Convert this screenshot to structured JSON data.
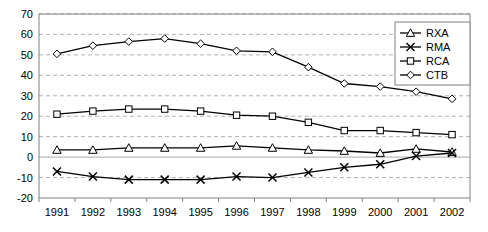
{
  "chart_data": {
    "type": "line",
    "title": "",
    "subtitle": "",
    "xlabel": "",
    "ylabel": "",
    "categories": [
      "1991",
      "1992",
      "1993",
      "1994",
      "1995",
      "1996",
      "1997",
      "1998",
      "1999",
      "2000",
      "2001",
      "2002"
    ],
    "x": [
      1991,
      1992,
      1993,
      1994,
      1995,
      1996,
      1997,
      1998,
      1999,
      2000,
      2001,
      2002
    ],
    "ylim": [
      -20,
      70
    ],
    "yticks": [
      -20,
      -10,
      0,
      10,
      20,
      30,
      40,
      50,
      60,
      70
    ],
    "ytick_labels": [
      "-20",
      "-10",
      "0",
      "10",
      "20",
      "30",
      "40",
      "50",
      "60",
      "70"
    ],
    "grid": true,
    "grid_style": "dashed",
    "grid_color": "#999999",
    "zero_line": true,
    "legend_position": "top-right",
    "legend_border": true,
    "series": [
      {
        "name": "RXA",
        "marker": "triangle",
        "color": "#000000",
        "values": [
          3.5,
          3.5,
          4.5,
          4.5,
          4.5,
          5.5,
          4.5,
          3.5,
          3.0,
          2.0,
          4.0,
          2.5
        ]
      },
      {
        "name": "RMA",
        "marker": "cross",
        "color": "#000000",
        "values": [
          -7.0,
          -9.5,
          -11.0,
          -11.0,
          -11.0,
          -9.5,
          -10.0,
          -7.5,
          -5.0,
          -3.5,
          0.5,
          2.0
        ]
      },
      {
        "name": "RCA",
        "marker": "square",
        "color": "#000000",
        "values": [
          21.0,
          22.5,
          23.5,
          23.5,
          22.5,
          20.5,
          20.0,
          17.0,
          13.0,
          13.0,
          12.0,
          11.0
        ]
      },
      {
        "name": "CTB",
        "marker": "diamond",
        "color": "#000000",
        "values": [
          50.5,
          54.5,
          56.5,
          58.0,
          55.5,
          52.0,
          51.5,
          44.0,
          36.0,
          34.5,
          32.0,
          28.5
        ]
      }
    ]
  },
  "legend": {
    "entries": [
      {
        "label": "RXA",
        "marker": "triangle"
      },
      {
        "label": "RMA",
        "marker": "cross"
      },
      {
        "label": "RCA",
        "marker": "square"
      },
      {
        "label": "CTB",
        "marker": "diamond"
      }
    ]
  }
}
